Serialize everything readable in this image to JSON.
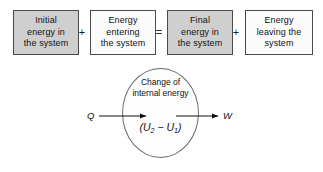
{
  "diagram": {
    "equation": {
      "terms": [
        {
          "id": "initial-energy",
          "text": "Initial energy in the system",
          "lines": [
            "Initial",
            "energy in",
            "the system"
          ],
          "fill": "#cfcfcf",
          "shaded": true
        },
        {
          "id": "energy-entering",
          "text": "Energy entering the system",
          "lines": [
            "Energy",
            "entering",
            "the system"
          ],
          "fill": "#fbfbfb",
          "shaded": false
        },
        {
          "id": "final-energy",
          "text": "Final energy in the system",
          "lines": [
            "Final",
            "energy in",
            "the system"
          ],
          "fill": "#cfcfcf",
          "shaded": true
        },
        {
          "id": "energy-leaving",
          "text": "Energy leaving the system",
          "lines": [
            "Energy",
            "leaving the",
            "system"
          ],
          "fill": "#fbfbfb",
          "shaded": false
        }
      ],
      "operators": [
        {
          "id": "plus-1",
          "symbol": "+"
        },
        {
          "id": "equals",
          "symbol": "="
        },
        {
          "id": "plus-2",
          "symbol": "+"
        }
      ]
    },
    "system": {
      "shape": "ellipse",
      "label_lines": [
        "Change of",
        "internal energy"
      ],
      "formula": {
        "open_paren": "(",
        "var_1": "U",
        "sub_1": "2",
        "minus": "−",
        "var_2": "U",
        "sub_2": "1",
        "close_paren": ")"
      },
      "heat_in": {
        "id": "heat-transfer",
        "label": "Q"
      },
      "work_out": {
        "id": "work-transfer",
        "label": "W"
      }
    },
    "colors": {
      "shaded_box": "#cfcfcf",
      "plain_box": "#fbfbfb",
      "box_border": "#4a4a4a",
      "ellipse_border": "#6a6a6a",
      "text": "#111111",
      "background": "#ffffff"
    }
  }
}
